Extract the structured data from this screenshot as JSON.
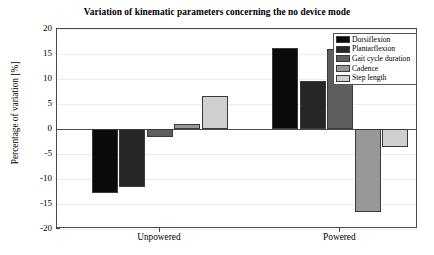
{
  "chart_data": {
    "type": "bar",
    "title": "Variation of kinematic parameters concerning the no device mode",
    "xlabel": "",
    "ylabel": "Percentage of variation [%]",
    "categories": [
      "Unpowered",
      "Powered"
    ],
    "ylim": [
      -20,
      20
    ],
    "yticks": [
      20,
      15,
      10,
      5,
      0,
      -5,
      -10,
      -15,
      -20
    ],
    "ytick_labels": [
      "20",
      "15",
      "10",
      "5",
      "0",
      "-5",
      "-10",
      "-15",
      "-20"
    ],
    "grid": true,
    "legend_position": "top-right",
    "series": [
      {
        "name": "Dorsiflexion",
        "color": "#0a0a0a",
        "values": [
          -12.7,
          16.2
        ]
      },
      {
        "name": "Plantarflexion",
        "color": "#262626",
        "values": [
          -11.5,
          9.6
        ]
      },
      {
        "name": "Gait cycle duration",
        "color": "#5e5e5e",
        "values": [
          -1.5,
          16.1
        ]
      },
      {
        "name": "Cadence",
        "color": "#989898",
        "values": [
          1.0,
          -16.5
        ]
      },
      {
        "name": "Step length",
        "color": "#cfcfcf",
        "values": [
          6.6,
          -3.6
        ]
      }
    ]
  }
}
